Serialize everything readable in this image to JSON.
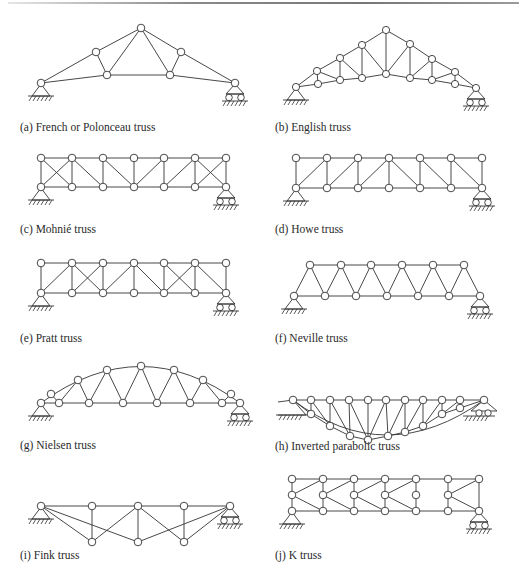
{
  "figure": {
    "captions": {
      "a": "(a) French or Polonceau truss",
      "b": "(b) English truss",
      "c": "(c) Mohnié truss",
      "d": "(d) Howe truss",
      "e": "(e) Pratt truss",
      "f": "(f) Neville truss",
      "g": "(g) Nielsen truss",
      "h": "(h) Inverted parabolic truss",
      "i": "(i) Fink truss",
      "j": "(j) K truss"
    },
    "panels": [
      {
        "id": "a",
        "name": "French or Polonceau truss",
        "caption_pos": [
          20,
          122
        ],
        "nodes": [
          [
            41,
            83
          ],
          [
            96,
            52
          ],
          [
            107,
            75
          ],
          [
            141,
            28
          ],
          [
            170,
            75
          ],
          [
            181,
            52
          ],
          [
            235,
            83
          ]
        ],
        "members": [
          [
            0,
            1
          ],
          [
            1,
            3
          ],
          [
            3,
            5
          ],
          [
            5,
            6
          ],
          [
            0,
            2
          ],
          [
            2,
            4
          ],
          [
            4,
            6
          ],
          [
            1,
            2
          ],
          [
            2,
            3
          ],
          [
            3,
            4
          ],
          [
            4,
            5
          ]
        ],
        "pin": 0,
        "roller": 6
      },
      {
        "id": "b",
        "name": "English truss",
        "caption_pos": [
          275,
          122
        ],
        "nodes": [
          [
            296,
            87
          ],
          [
            317,
            71
          ],
          [
            318,
            84
          ],
          [
            340,
            58
          ],
          [
            340,
            80
          ],
          [
            362,
            45
          ],
          [
            362,
            78
          ],
          [
            386,
            30
          ],
          [
            386,
            74
          ],
          [
            410,
            44
          ],
          [
            410,
            78
          ],
          [
            432,
            59
          ],
          [
            432,
            80
          ],
          [
            455,
            72
          ],
          [
            455,
            84
          ],
          [
            476,
            88
          ]
        ],
        "members": [
          [
            0,
            1
          ],
          [
            1,
            3
          ],
          [
            3,
            5
          ],
          [
            5,
            7
          ],
          [
            7,
            9
          ],
          [
            9,
            11
          ],
          [
            11,
            13
          ],
          [
            13,
            15
          ],
          [
            0,
            2
          ],
          [
            2,
            4
          ],
          [
            4,
            6
          ],
          [
            6,
            8
          ],
          [
            8,
            10
          ],
          [
            10,
            12
          ],
          [
            12,
            14
          ],
          [
            14,
            15
          ],
          [
            1,
            2
          ],
          [
            1,
            4
          ],
          [
            3,
            4
          ],
          [
            3,
            6
          ],
          [
            5,
            6
          ],
          [
            5,
            8
          ],
          [
            7,
            8
          ],
          [
            8,
            9
          ],
          [
            9,
            10
          ],
          [
            10,
            11
          ],
          [
            11,
            12
          ],
          [
            12,
            13
          ],
          [
            13,
            14
          ]
        ],
        "pin": 0,
        "roller": 15
      },
      {
        "id": "c",
        "name": "Mohnié truss",
        "caption_pos": [
          20,
          224
        ],
        "top_y": 158,
        "bottom_y": 187,
        "xs": [
          41,
          72,
          103,
          134,
          164,
          195,
          226
        ],
        "diagonals": [
          [
            0,
            1,
            "t2b"
          ],
          [
            1,
            2,
            "t2b"
          ],
          [
            2,
            3,
            "t2b"
          ],
          [
            3,
            4,
            "b2t"
          ],
          [
            4,
            5,
            "b2t"
          ],
          [
            5,
            6,
            "b2t"
          ],
          [
            1,
            0,
            "x"
          ],
          [
            2,
            1,
            "x"
          ],
          [
            4,
            3,
            "x"
          ],
          [
            5,
            4,
            "x"
          ]
        ],
        "pin": "bottom-0",
        "roller": "bottom-6"
      },
      {
        "id": "d",
        "name": "Howe truss",
        "caption_pos": [
          275,
          224
        ],
        "top_y": 158,
        "bottom_y": 188,
        "xs": [
          296,
          327,
          358,
          389,
          420,
          451,
          482
        ],
        "pin": "bottom-0",
        "roller": "bottom-6"
      },
      {
        "id": "e",
        "name": "Pratt truss",
        "caption_pos": [
          20,
          333
        ],
        "top_y": 263,
        "bottom_y": 293,
        "xs": [
          41,
          72,
          103,
          134,
          164,
          195,
          226
        ],
        "pin": "bottom-0",
        "roller": "bottom-6"
      },
      {
        "id": "f",
        "name": "Neville truss",
        "caption_pos": [
          275,
          333
        ],
        "top_y": 265,
        "bottom_y": 296,
        "top_xs": [
          310,
          341,
          371,
          402,
          433,
          464
        ],
        "bottom_xs": [
          294,
          325,
          356,
          387,
          418,
          449,
          480
        ],
        "pin": "bottom-0",
        "roller": "bottom-6"
      },
      {
        "id": "g",
        "name": "Nielsen truss",
        "caption_pos": [
          20,
          440
        ],
        "top_nodes": [
          [
            51,
            366
          ],
          [
            78,
            358
          ],
          [
            107,
            346
          ],
          [
            141,
            367
          ],
          [
            174,
            346
          ],
          [
            201,
            358
          ],
          [
            228,
            366
          ]
        ],
        "pin": "bottom-0",
        "roller": "bottom-last"
      },
      {
        "id": "h",
        "name": "Inverted parabolic truss",
        "caption_pos": [
          275,
          441
        ],
        "pin": "left",
        "roller": "right"
      },
      {
        "id": "i",
        "name": "Fink truss",
        "caption_pos": [
          20,
          550
        ],
        "pin": "top-0",
        "roller": "top-last"
      },
      {
        "id": "j",
        "name": "K truss",
        "caption_pos": [
          275,
          550
        ],
        "pin": "bottom-0",
        "roller": "bottom-last"
      }
    ]
  }
}
